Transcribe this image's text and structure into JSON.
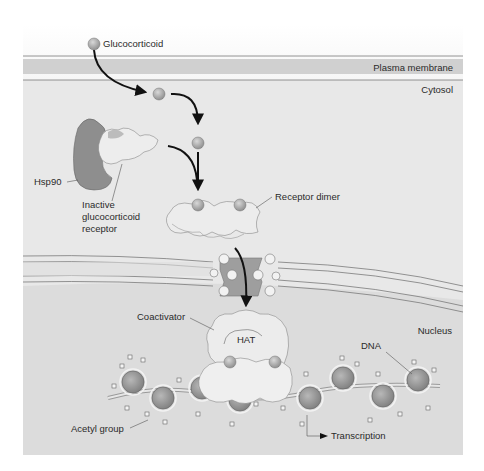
{
  "figure": {
    "labels": {
      "glucocorticoid": "Glucocorticoid",
      "plasma_membrane": "Plasma membrane",
      "cytosol": "Cytosol",
      "hsp90": "Hsp90",
      "inactive_receptor_line1": "Inactive",
      "inactive_receptor_line2": "glucocorticoid",
      "inactive_receptor_line3": "receptor",
      "receptor_dimer": "Receptor dimer",
      "coactivator": "Coactivator",
      "hat": "HAT",
      "nucleus": "Nucleus",
      "dna": "DNA",
      "acetyl_group": "Acetyl group",
      "transcription": "Transcription"
    },
    "colors": {
      "background": "#ffffff",
      "panel": "#e6e6e6",
      "membrane_band": "#d2d2d2",
      "nucleus_fill": "#d9d9d9",
      "hsp90": "#8c8c8c",
      "receptor": "#ececec",
      "receptor_shadow": "#bdbdbd",
      "ligand": "#a8a8a8",
      "arrow": "#111111",
      "pore": "#9a9a9a"
    }
  }
}
